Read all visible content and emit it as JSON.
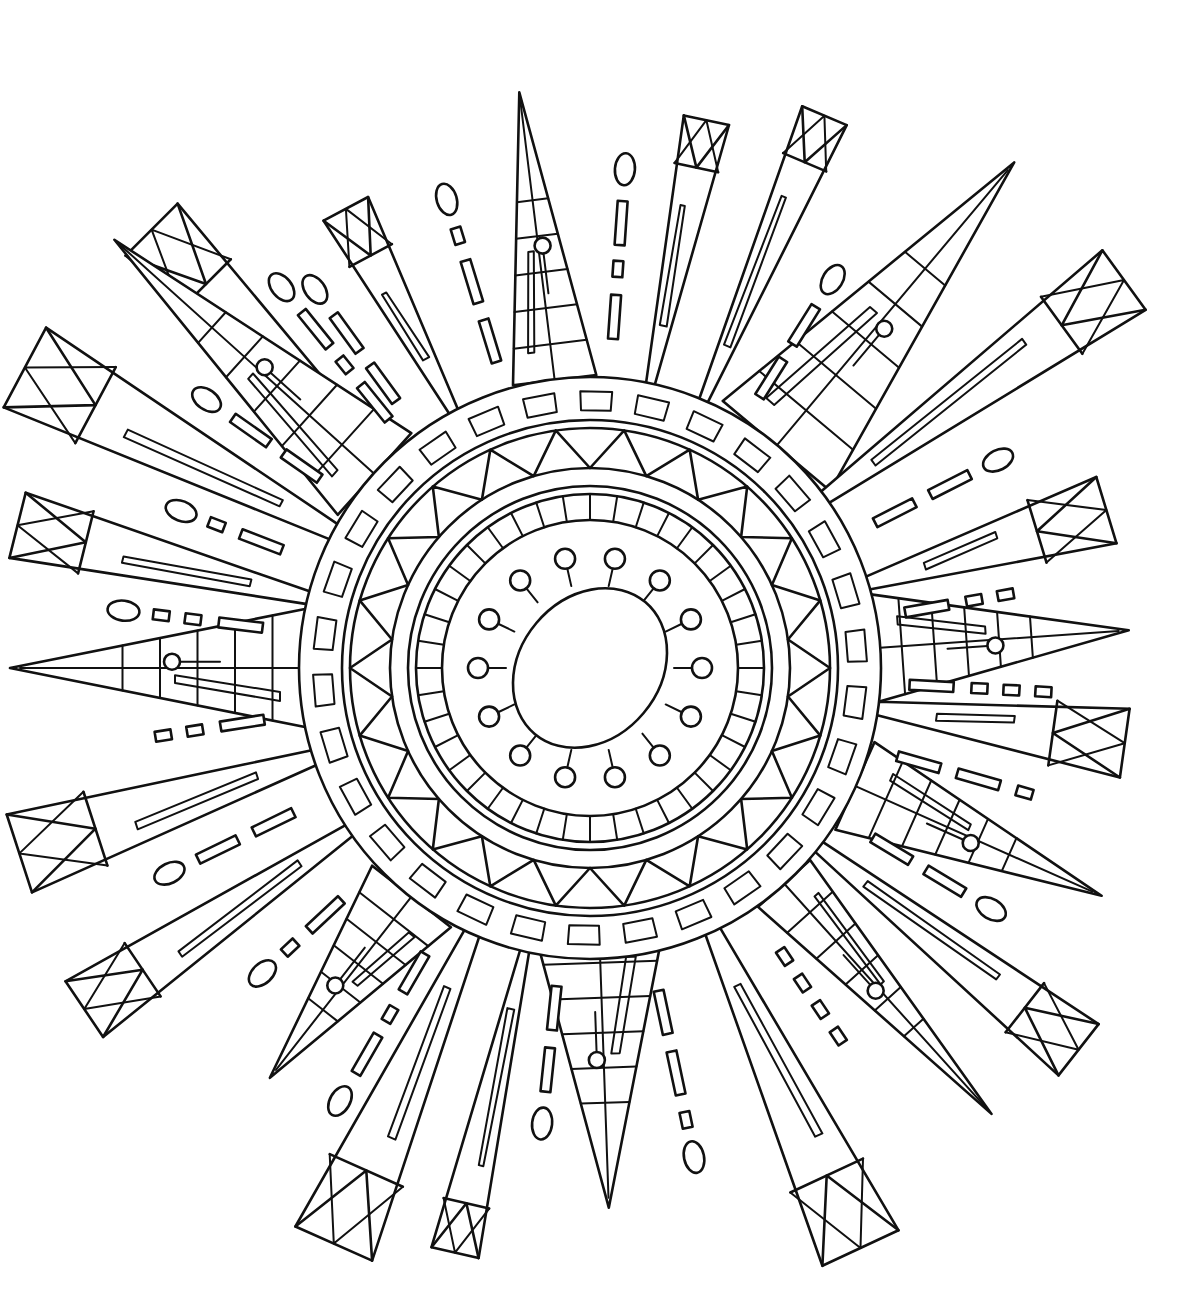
{
  "artwork": {
    "title": "",
    "kind": "coloring-page-sunburst-mandala",
    "background": "#ffffff",
    "ink": "#111111",
    "center": {
      "x": 590,
      "y": 668
    },
    "core": {
      "rx": 70,
      "ry": 86,
      "tilt": -20
    },
    "rings": {
      "bead_ring_r": 112,
      "bead_count": 14,
      "tick_ring_inner": 148,
      "tick_ring_outer": 178,
      "tick_count": 40,
      "plain_ring_r": 198,
      "triangle_ring_inner": 200,
      "triangle_ring_outer": 240,
      "triangle_count": 22,
      "dash_ring_inner": 250,
      "dash_ring_outer": 285,
      "dash_count": 30
    },
    "rays": [
      {
        "name": "ray-top-left-long",
        "angle": -135,
        "base": 290,
        "len": 620,
        "width": 70,
        "cap": "box"
      },
      {
        "name": "ray-top-left-mid",
        "angle": -118,
        "base": 290,
        "len": 520,
        "width": 48,
        "cap": "box"
      },
      {
        "name": "ray-top-center",
        "angle": -97,
        "base": 290,
        "len": 580,
        "width": 84,
        "cap": "point"
      },
      {
        "name": "ray-top-right-a",
        "angle": -78,
        "base": 290,
        "len": 560,
        "width": 44,
        "cap": "box"
      },
      {
        "name": "ray-top-right-b",
        "angle": -67,
        "base": 290,
        "len": 600,
        "width": 46,
        "cap": "box"
      },
      {
        "name": "ray-upper-right-long",
        "angle": -50,
        "base": 290,
        "len": 660,
        "width": 140,
        "cap": "point"
      },
      {
        "name": "ray-right-upper",
        "angle": -36,
        "base": 290,
        "len": 660,
        "width": 70,
        "cap": "box"
      },
      {
        "name": "ray-right-a",
        "angle": -17,
        "base": 290,
        "len": 540,
        "width": 66,
        "cap": "box"
      },
      {
        "name": "ray-right-point",
        "angle": -4,
        "base": 280,
        "len": 540,
        "width": 110,
        "cap": "point"
      },
      {
        "name": "ray-right-b",
        "angle": 8,
        "base": 290,
        "len": 540,
        "width": 66,
        "cap": "box"
      },
      {
        "name": "ray-right-lower",
        "angle": 24,
        "base": 290,
        "len": 560,
        "width": 96,
        "cap": "point"
      },
      {
        "name": "ray-lower-right-box",
        "angle": 38,
        "base": 290,
        "len": 620,
        "width": 62,
        "cap": "box"
      },
      {
        "name": "ray-lower-right-point",
        "angle": 48,
        "base": 290,
        "len": 600,
        "width": 70,
        "cap": "point"
      },
      {
        "name": "ray-bottom-right-box",
        "angle": 65,
        "base": 290,
        "len": 640,
        "width": 80,
        "cap": "box"
      },
      {
        "name": "ray-bottom-center",
        "angle": 88,
        "base": 260,
        "len": 540,
        "width": 130,
        "cap": "point"
      },
      {
        "name": "ray-bottom-center-box",
        "angle": 103,
        "base": 290,
        "len": 600,
        "width": 46,
        "cap": "box"
      },
      {
        "name": "ray-bottom-left-box",
        "angle": 114,
        "base": 290,
        "len": 630,
        "width": 80,
        "cap": "box"
      },
      {
        "name": "ray-bottom-left-point",
        "angle": 128,
        "base": 290,
        "len": 520,
        "width": 100,
        "cap": "point"
      },
      {
        "name": "ray-lower-left-box",
        "angle": 146,
        "base": 290,
        "len": 610,
        "width": 64,
        "cap": "box"
      },
      {
        "name": "ray-left-lower",
        "angle": 162,
        "base": 290,
        "len": 600,
        "width": 78,
        "cap": "box"
      },
      {
        "name": "ray-left-point",
        "angle": 180,
        "base": 280,
        "len": 580,
        "width": 120,
        "cap": "point"
      },
      {
        "name": "ray-left-box",
        "angle": 194,
        "base": 290,
        "len": 590,
        "width": 64,
        "cap": "box"
      },
      {
        "name": "ray-left-upper",
        "angle": 208,
        "base": 290,
        "len": 640,
        "width": 86,
        "cap": "box"
      },
      {
        "name": "ray-upper-left-point",
        "angle": 222,
        "base": 290,
        "len": 640,
        "width": 110,
        "cap": "point"
      }
    ],
    "gap_marks": [
      {
        "angle": -126,
        "from": 330,
        "items": [
          "dash",
          "dash",
          "oval"
        ]
      },
      {
        "angle": -107,
        "from": 320,
        "items": [
          "dash",
          "dash",
          "small",
          "oval"
        ]
      },
      {
        "angle": -86,
        "from": 330,
        "items": [
          "dash",
          "small",
          "dash",
          "oval"
        ]
      },
      {
        "angle": -58,
        "from": 320,
        "items": [
          "dash",
          "dash",
          "oval"
        ]
      },
      {
        "angle": -27,
        "from": 320,
        "items": [
          "dash",
          "dash",
          "oval"
        ]
      },
      {
        "angle": -10,
        "from": 320,
        "items": [
          "dash",
          "small",
          "small"
        ]
      },
      {
        "angle": 3,
        "from": 320,
        "items": [
          "dash",
          "small",
          "small",
          "small"
        ]
      },
      {
        "angle": 16,
        "from": 320,
        "items": [
          "dash",
          "dash",
          "small"
        ]
      },
      {
        "angle": 31,
        "from": 330,
        "items": [
          "dash",
          "dash",
          "oval"
        ]
      },
      {
        "angle": 56,
        "from": 340,
        "items": [
          "small",
          "small",
          "small",
          "small"
        ]
      },
      {
        "angle": 78,
        "from": 330,
        "items": [
          "dash",
          "dash",
          "small",
          "oval"
        ]
      },
      {
        "angle": 96,
        "from": 320,
        "items": [
          "dash",
          "dash",
          "oval"
        ]
      },
      {
        "angle": 120,
        "from": 330,
        "items": [
          "dash",
          "small",
          "dash",
          "oval"
        ]
      },
      {
        "angle": 137,
        "from": 340,
        "items": [
          "dash",
          "small",
          "oval"
        ]
      },
      {
        "angle": 154,
        "from": 330,
        "items": [
          "dash",
          "dash",
          "oval"
        ]
      },
      {
        "angle": 171,
        "from": 330,
        "items": [
          "dash",
          "small",
          "small"
        ]
      },
      {
        "angle": 187,
        "from": 330,
        "items": [
          "dash",
          "small",
          "small",
          "oval"
        ]
      },
      {
        "angle": 201,
        "from": 330,
        "items": [
          "dash",
          "small",
          "oval"
        ]
      },
      {
        "angle": 215,
        "from": 330,
        "items": [
          "dash",
          "dash",
          "oval"
        ]
      },
      {
        "angle": 231,
        "from": 320,
        "items": [
          "dash",
          "small",
          "dash",
          "oval"
        ]
      }
    ]
  }
}
